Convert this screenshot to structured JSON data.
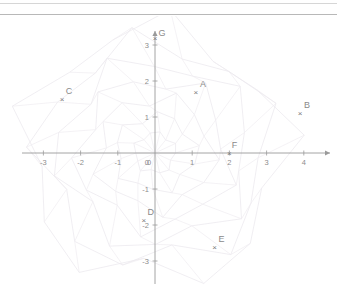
{
  "page": {
    "background_color": "#ffffff",
    "divider_color_top": "#d6d6d6",
    "divider_color_bottom": "#b8b8b8"
  },
  "chart_data": {
    "type": "scatter",
    "title": "",
    "xlabel": "",
    "ylabel": "",
    "xlim": [
      -3.5,
      4.6
    ],
    "ylim": [
      -3.5,
      3.6
    ],
    "grid": false,
    "background_pattern": "faint-radial-web",
    "axis_color": "#9a9a9a",
    "label_color": "#8d8d8d",
    "marker_color": "#7a7a7a",
    "marker_glyph": "×",
    "x_ticks": [
      {
        "value": -3,
        "label": "-3"
      },
      {
        "value": -2,
        "label": "-2"
      },
      {
        "value": -1,
        "label": "-1"
      },
      {
        "value": 0,
        "label": "0"
      },
      {
        "value": 1,
        "label": "1"
      },
      {
        "value": 2,
        "label": "2"
      },
      {
        "value": 3,
        "label": "3"
      },
      {
        "value": 4,
        "label": "4"
      }
    ],
    "y_ticks": [
      {
        "value": 3,
        "label": "3"
      },
      {
        "value": 2,
        "label": "2"
      },
      {
        "value": 1,
        "label": "1"
      },
      {
        "value": -1,
        "label": "-1"
      },
      {
        "value": -2,
        "label": "-2"
      },
      {
        "value": -3,
        "label": "-3"
      }
    ],
    "points": [
      {
        "name": "A",
        "x": 1.1,
        "y": 1.7,
        "label_dx": 7,
        "label_dy": -5
      },
      {
        "name": "B",
        "x": 3.9,
        "y": 1.1,
        "label_dx": 7,
        "label_dy": -5
      },
      {
        "name": "C",
        "x": -2.5,
        "y": 1.5,
        "label_dx": 7,
        "label_dy": -5
      },
      {
        "name": "D",
        "x": -0.3,
        "y": -1.85,
        "label_dx": 7,
        "label_dy": -5
      },
      {
        "name": "E",
        "x": 1.6,
        "y": -2.6,
        "label_dx": 7,
        "label_dy": -5
      },
      {
        "name": "F",
        "x": 2.0,
        "y": 0.0,
        "label_dx": 5,
        "label_dy": -5
      },
      {
        "name": "G",
        "x": 0.0,
        "y": 3.2,
        "label_dx": 7,
        "label_dy": -2
      }
    ]
  }
}
